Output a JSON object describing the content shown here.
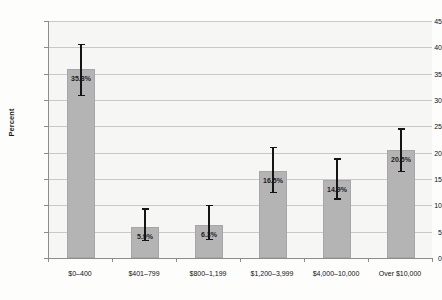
{
  "chart_data": {
    "type": "bar",
    "title": "",
    "subtitle": "",
    "xlabel": "",
    "ylabel": "Percent",
    "ylim": [
      0,
      45
    ],
    "ytick_step": 5,
    "yticks": [
      0,
      5,
      10,
      15,
      20,
      25,
      30,
      35,
      40,
      45
    ],
    "grid": true,
    "legend": "none",
    "categories": [
      "$0–400",
      "$401–799",
      "$800–1,199",
      "$1,200–3,999",
      "$4,000–10,000",
      "Over $10,000"
    ],
    "values": [
      35.8,
      5.9,
      6.3,
      16.5,
      14.9,
      20.5
    ],
    "value_labels": [
      "35.8%",
      "5.9%",
      "6.3%",
      "16.5%",
      "14.9%",
      "20.5%"
    ],
    "error_bars": [
      {
        "low": 31.0,
        "high": 40.7
      },
      {
        "low": 3.5,
        "high": 9.5
      },
      {
        "low": 3.7,
        "high": 10.1
      },
      {
        "low": 12.6,
        "high": 21.1
      },
      {
        "low": 11.3,
        "high": 19.0
      },
      {
        "low": 16.6,
        "high": 24.6
      }
    ],
    "colors": {
      "bar_fill": "#b4b4b4",
      "bar_edge": "#a6a6a6",
      "error_bar": "#151515",
      "gridline": "#c9c9c7",
      "axis": "#8d8d8d",
      "plot_background": "#f6f6f4",
      "text": "#111111"
    }
  }
}
